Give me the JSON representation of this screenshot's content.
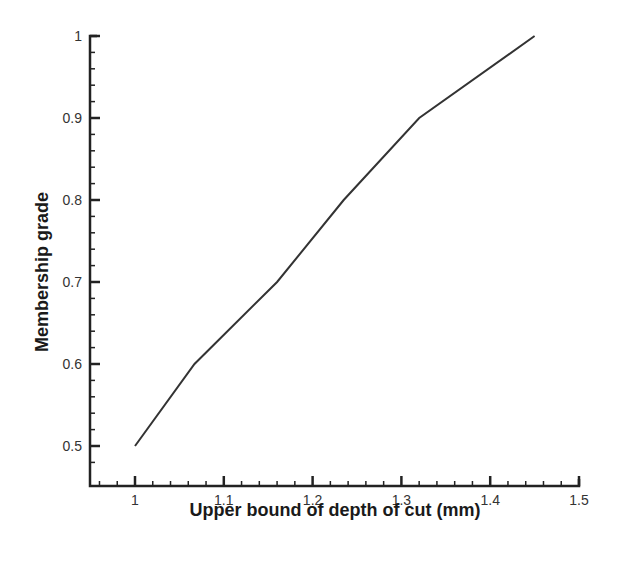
{
  "chart_data": {
    "type": "line",
    "title": "",
    "xlabel": "Upper bound of depth of cut (mm)",
    "ylabel": "Membership grade",
    "xlim": [
      0.95,
      1.5
    ],
    "ylim": [
      0.46,
      1.0
    ],
    "x_ticks": [
      "1",
      "1.1",
      "1.2",
      "1.3",
      "1.4",
      "1.5"
    ],
    "y_ticks": [
      "0.5",
      "0.6",
      "0.7",
      "0.8",
      "0.9",
      "1"
    ],
    "grid": false,
    "legend": null,
    "series": [
      {
        "name": "membership",
        "color": "#333333",
        "x": [
          1.0,
          1.067,
          1.16,
          1.235,
          1.32,
          1.45
        ],
        "y": [
          0.5,
          0.6,
          0.7,
          0.8,
          0.9,
          1.0
        ]
      }
    ]
  },
  "labels": {
    "xlabel": "Upper bound of depth of cut (mm)",
    "ylabel": "Membership grade",
    "x_ticks": [
      "1",
      "1.1",
      "1.2",
      "1.3",
      "1.4",
      "1.5"
    ],
    "y_ticks": [
      "0.5",
      "0.6",
      "0.7",
      "0.8",
      "0.9",
      "1"
    ]
  }
}
